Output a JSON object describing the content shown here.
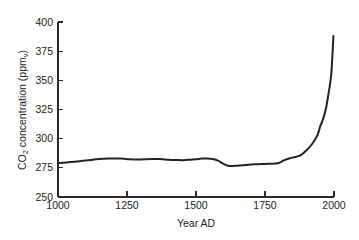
{
  "chart_data": {
    "type": "line",
    "title": "",
    "xlabel": "Year AD",
    "ylabel": "CO2 concentration (ppmv)",
    "ylabel_main": "CO",
    "ylabel_sub": "2",
    "ylabel_rest": " concentration (ppm",
    "ylabel_sub2": "v",
    "ylabel_end": ")",
    "xlim": [
      1000,
      2000
    ],
    "ylim": [
      250,
      400
    ],
    "xticks": [
      1000,
      1250,
      1500,
      1750,
      2000
    ],
    "yticks": [
      250,
      275,
      300,
      325,
      350,
      375,
      400
    ],
    "xtick_labels": [
      "1000",
      "1250",
      "1500",
      "1750",
      "2000"
    ],
    "ytick_labels": [
      "250",
      "275",
      "300",
      "325",
      "350",
      "375",
      "400"
    ],
    "grid": false,
    "legend": "none",
    "line_color": "#232323",
    "axis_color": "#2b2b2b",
    "background": "#ffffff",
    "series": [
      {
        "name": "Atmospheric CO2 concentration",
        "x": [
          1000,
          1030,
          1060,
          1090,
          1120,
          1150,
          1180,
          1200,
          1230,
          1260,
          1290,
          1310,
          1340,
          1370,
          1400,
          1430,
          1450,
          1470,
          1500,
          1520,
          1540,
          1560,
          1580,
          1600,
          1620,
          1650,
          1680,
          1710,
          1740,
          1760,
          1780,
          1800,
          1820,
          1840,
          1860,
          1880,
          1900,
          1920,
          1940,
          1950,
          1960,
          1970,
          1980,
          1990,
          1998
        ],
        "y": [
          279.2,
          279.6,
          280.2,
          281.0,
          281.8,
          282.5,
          283.0,
          283.1,
          282.9,
          282.4,
          282.1,
          282.3,
          282.6,
          282.5,
          282.0,
          281.7,
          281.6,
          281.9,
          282.4,
          282.9,
          283.0,
          282.6,
          281.2,
          278.4,
          276.6,
          276.8,
          277.4,
          278.0,
          278.3,
          278.4,
          278.6,
          279.2,
          281.6,
          283.2,
          284.3,
          285.9,
          290.0,
          295.2,
          303.0,
          310.5,
          316.5,
          325.0,
          338.5,
          355.0,
          388.0
        ]
      }
    ]
  },
  "axes": {
    "plot_left_px": 58,
    "plot_right_px": 334,
    "plot_top_px": 22,
    "plot_bottom_px": 197
  }
}
